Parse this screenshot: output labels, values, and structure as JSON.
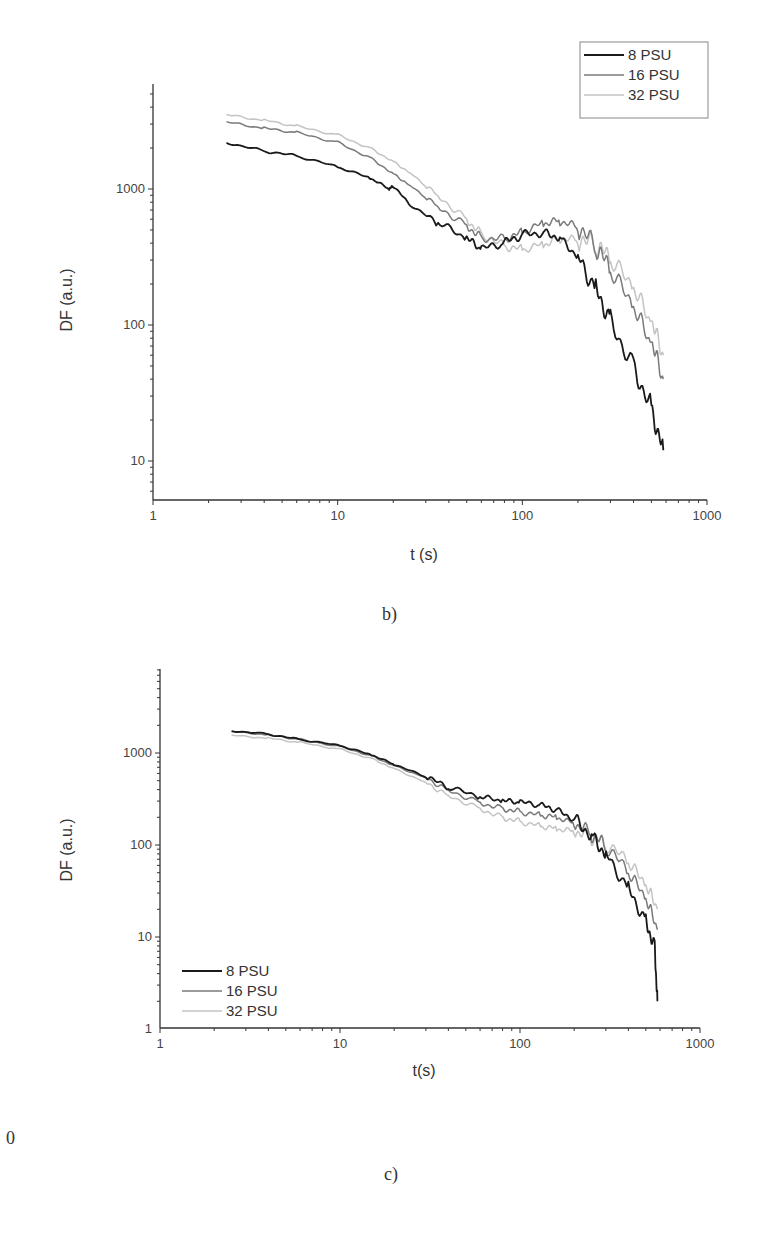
{
  "page": {
    "stray_text": "0",
    "captions": [
      "b)",
      "c)"
    ]
  },
  "colors": {
    "8 PSU": "#1a1a1a",
    "16 PSU": "#7a7a7a",
    "32 PSU": "#c4c4c4",
    "axis": "#333333"
  },
  "chart_data": [
    {
      "id": "b",
      "type": "line",
      "title": "",
      "caption": "b)",
      "xlabel": "t (s)",
      "ylabel": "DF (a.u.)",
      "xscale": "log",
      "yscale": "log",
      "xlim": [
        1,
        1000
      ],
      "ylim": [
        5,
        6000
      ],
      "xticks": [
        "1",
        "10",
        "100",
        "1000"
      ],
      "yticks": [
        "10",
        "100",
        "1000"
      ],
      "grid": false,
      "legend_position": "upper right (boxed)",
      "legend": [
        "8 PSU",
        "16 PSU",
        "32 PSU"
      ],
      "series": [
        {
          "name": "8 PSU",
          "x": [
            2.5,
            4,
            6,
            10,
            15,
            19,
            20,
            25,
            35,
            50,
            60,
            80,
            100,
            130,
            160,
            200,
            250,
            300,
            400,
            500,
            580
          ],
          "y": [
            2200,
            1900,
            1750,
            1450,
            1200,
            1000,
            1050,
            750,
            560,
            430,
            360,
            400,
            460,
            480,
            440,
            320,
            190,
            110,
            50,
            25,
            12
          ]
        },
        {
          "name": "16 PSU",
          "x": [
            2.5,
            4,
            6,
            10,
            15,
            20,
            25,
            35,
            50,
            60,
            80,
            100,
            130,
            160,
            200,
            250,
            300,
            400,
            500,
            580
          ],
          "y": [
            3100,
            2800,
            2600,
            2200,
            1700,
            1300,
            1050,
            750,
            540,
            440,
            430,
            480,
            560,
            580,
            520,
            370,
            250,
            130,
            70,
            40
          ]
        },
        {
          "name": "32 PSU",
          "x": [
            2.5,
            4,
            6,
            10,
            15,
            20,
            25,
            35,
            50,
            60,
            80,
            100,
            130,
            160,
            200,
            250,
            300,
            400,
            500,
            580
          ],
          "y": [
            3500,
            3200,
            2900,
            2500,
            2000,
            1600,
            1300,
            900,
            600,
            470,
            380,
            360,
            390,
            430,
            420,
            380,
            300,
            180,
            100,
            60
          ]
        }
      ]
    },
    {
      "id": "c",
      "type": "line",
      "title": "",
      "caption": "c)",
      "xlabel": "t(s)",
      "ylabel": "DF (a.u.)",
      "xscale": "log",
      "yscale": "log",
      "xlim": [
        1,
        1000
      ],
      "ylim": [
        1,
        3000
      ],
      "xticks": [
        "1",
        "10",
        "100",
        "1000"
      ],
      "yticks": [
        "1",
        "10",
        "100",
        "1000"
      ],
      "grid": false,
      "legend_position": "lower left",
      "legend": [
        "8 PSU",
        "16 PSU",
        "32 PSU"
      ],
      "series": [
        {
          "name": "8 PSU",
          "x": [
            2.5,
            4,
            6,
            10,
            15,
            20,
            30,
            40,
            60,
            80,
            100,
            130,
            160,
            200,
            250,
            300,
            400,
            500,
            560,
            580
          ],
          "y": [
            1750,
            1600,
            1400,
            1200,
            950,
            750,
            550,
            420,
            330,
            300,
            290,
            270,
            240,
            190,
            130,
            80,
            35,
            15,
            8,
            2
          ]
        },
        {
          "name": "16 PSU",
          "x": [
            2.5,
            4,
            6,
            10,
            15,
            20,
            30,
            40,
            60,
            80,
            100,
            130,
            160,
            200,
            250,
            300,
            400,
            500,
            580
          ],
          "y": [
            1700,
            1580,
            1400,
            1180,
            930,
            730,
            540,
            400,
            290,
            250,
            230,
            210,
            200,
            170,
            130,
            95,
            50,
            25,
            12
          ]
        },
        {
          "name": "32 PSU",
          "x": [
            2.5,
            4,
            6,
            10,
            15,
            20,
            30,
            40,
            60,
            80,
            100,
            130,
            160,
            200,
            250,
            300,
            400,
            500,
            580
          ],
          "y": [
            1550,
            1450,
            1300,
            1100,
            870,
            680,
            480,
            350,
            250,
            200,
            180,
            160,
            150,
            140,
            120,
            100,
            65,
            35,
            20
          ]
        }
      ]
    }
  ]
}
